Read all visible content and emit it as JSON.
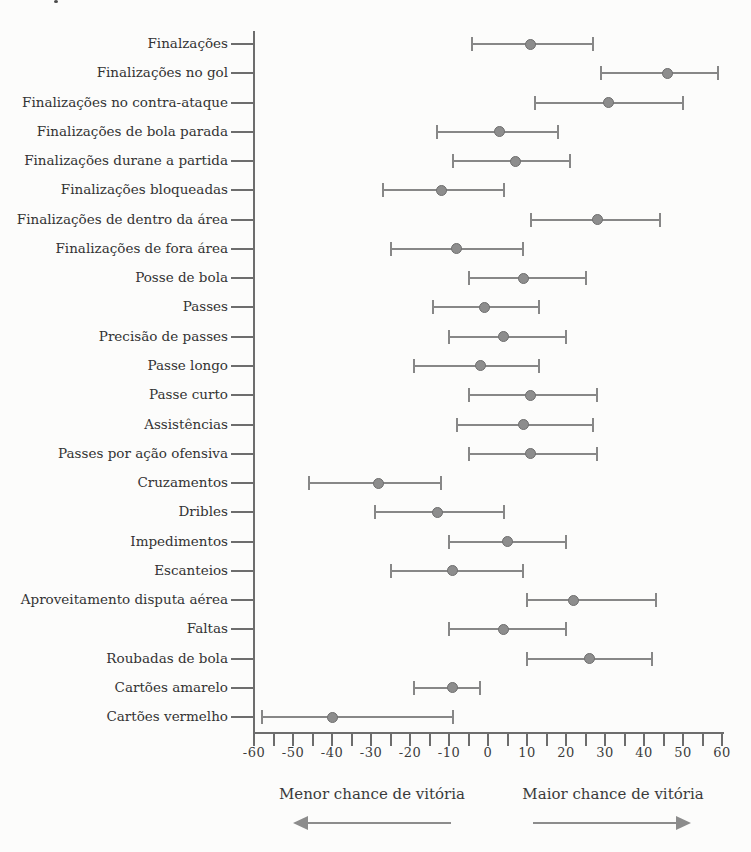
{
  "chart_data": {
    "type": "dot_interval",
    "axis": {
      "min": -60,
      "max": 60,
      "minor_step": 5,
      "major_step": 10,
      "tick_labels": [
        "-60",
        "-50",
        "-40",
        "-30",
        "-20",
        "-10",
        "0",
        "10",
        "20",
        "30",
        "40",
        "50",
        "60"
      ]
    },
    "rows": [
      {
        "label": "Finalzações",
        "low": -4,
        "mid": 11,
        "high": 27
      },
      {
        "label": "Finalizações no gol",
        "low": 29,
        "mid": 46,
        "high": 59
      },
      {
        "label": "Finalizações no contra-ataque",
        "low": 12,
        "mid": 31,
        "high": 50
      },
      {
        "label": "Finalizações de bola parada",
        "low": -13,
        "mid": 3,
        "high": 18
      },
      {
        "label": "Finalizações durane a partida",
        "low": -9,
        "mid": 7,
        "high": 21
      },
      {
        "label": "Finalizações bloqueadas",
        "low": -27,
        "mid": -12,
        "high": 4
      },
      {
        "label": "Finalizações de dentro da área",
        "low": 11,
        "mid": 28,
        "high": 44
      },
      {
        "label": "Finalizações de fora área",
        "low": -25,
        "mid": -8,
        "high": 9
      },
      {
        "label": "Posse de bola",
        "low": -5,
        "mid": 9,
        "high": 25
      },
      {
        "label": "Passes",
        "low": -14,
        "mid": -1,
        "high": 13
      },
      {
        "label": "Precisão de passes",
        "low": -10,
        "mid": 4,
        "high": 20
      },
      {
        "label": "Passe longo",
        "low": -19,
        "mid": -2,
        "high": 13
      },
      {
        "label": "Passe curto",
        "low": -5,
        "mid": 11,
        "high": 28
      },
      {
        "label": "Assistências",
        "low": -8,
        "mid": 9,
        "high": 27
      },
      {
        "label": "Passes por ação ofensiva",
        "low": -5,
        "mid": 11,
        "high": 28
      },
      {
        "label": "Cruzamentos",
        "low": -46,
        "mid": -28,
        "high": -12
      },
      {
        "label": "Dribles",
        "low": -29,
        "mid": -13,
        "high": 4
      },
      {
        "label": "Impedimentos",
        "low": -10,
        "mid": 5,
        "high": 20
      },
      {
        "label": "Escanteios",
        "low": -25,
        "mid": -9,
        "high": 9
      },
      {
        "label": "Aproveitamento disputa aérea",
        "low": 10,
        "mid": 22,
        "high": 43
      },
      {
        "label": "Faltas",
        "low": -10,
        "mid": 4,
        "high": 20
      },
      {
        "label": "Roubadas de bola",
        "low": 10,
        "mid": 26,
        "high": 42
      },
      {
        "label": "Cartões amarelo",
        "low": -19,
        "mid": -9,
        "high": -2
      },
      {
        "label": "Cartões vermelho",
        "low": -58,
        "mid": -40,
        "high": -9
      }
    ],
    "annotations": {
      "left": "Menor chance de vitória",
      "right": "Maior chance de vitória"
    },
    "colors": {
      "marker": "#8d8d8d",
      "marker_edge": "#6e6e6e",
      "interval_line": "#878787",
      "axis": "#6d6d6d",
      "text": "#3c3c3c",
      "arrow": "#8c8c8c",
      "background": "#fcfcfb"
    },
    "legend_position": "bottom",
    "grid": false
  }
}
